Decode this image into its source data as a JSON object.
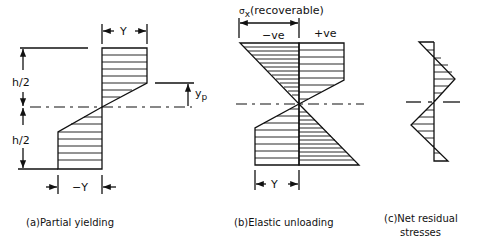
{
  "figure": {
    "panel_a": {
      "caption": "(a)Partial yielding",
      "labels": {
        "top_dimension": "Y",
        "bottom_dimension": "−Y",
        "upper_half_height": "h/2",
        "lower_half_height": "h/2",
        "yield_depth": "y",
        "yield_depth_subscript": "p"
      }
    },
    "panel_b": {
      "caption": "(b)Elastic unloading",
      "labels": {
        "title_symbol": "σ",
        "title_subscript": "x",
        "title_text": "(recoverable)",
        "negative": "−ve",
        "positive": "+ve",
        "bottom_dimension": "−Y−"
      }
    },
    "panel_c": {
      "caption_line1": "(c)Net residual",
      "caption_line2": "stresses"
    }
  }
}
